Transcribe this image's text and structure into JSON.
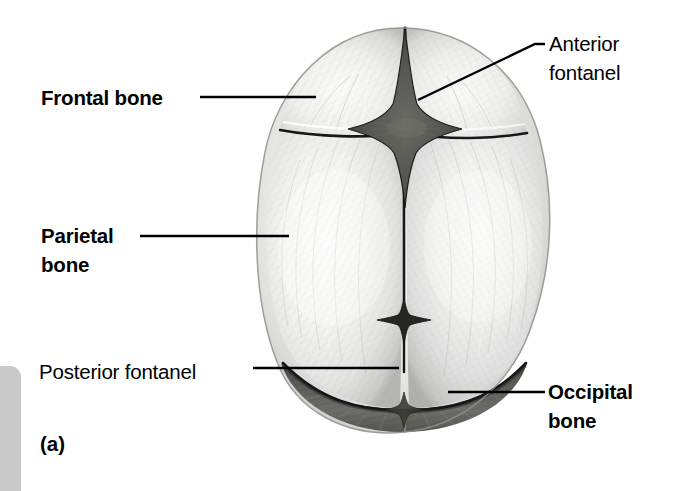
{
  "figure": {
    "panel_letter": "(a)",
    "background_color": "#ffffff",
    "ink_color": "#000000",
    "side_tab_color": "#c9c9c9"
  },
  "labels": {
    "frontal_bone": {
      "text": "Frontal bone",
      "weight": "bold",
      "lines": [
        "Frontal bone"
      ]
    },
    "parietal_bone": {
      "text": "Parietal\nbone",
      "weight": "bold",
      "lines": [
        "Parietal",
        "bone"
      ]
    },
    "posterior_fontanel": {
      "text": "Posterior fontanel",
      "weight": "regular",
      "lines": [
        "Posterior fontanel"
      ]
    },
    "anterior_fontanel": {
      "text": "Anterior\nfontanel",
      "weight": "regular",
      "lines": [
        "Anterior",
        "fontanel"
      ]
    },
    "occipital_bone": {
      "text": "Occipital\nbone",
      "weight": "bold",
      "lines": [
        "Occipital",
        "bone"
      ]
    }
  },
  "anatomy": {
    "structures": [
      "frontal bone",
      "parietal bone",
      "occipital bone",
      "anterior fontanel",
      "posterior fontanel",
      "sagittal suture",
      "coronal suture",
      "lambdoid suture",
      "frontal (metopic) suture"
    ],
    "view": "superior view of fetal skull"
  }
}
